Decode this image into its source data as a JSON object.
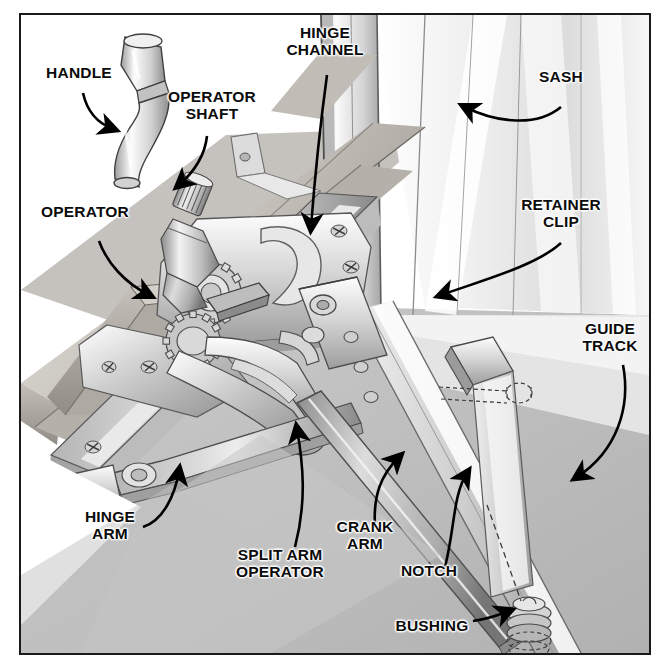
{
  "document": {
    "type": "technical-illustration",
    "subject": "Casement window split arm operator assembly",
    "style": "grayscale isometric cutaway line drawing",
    "frame_border_color": "#1a1a1a",
    "background_color": "#ffffff"
  },
  "callouts": [
    {
      "id": "handle",
      "label": "HANDLE",
      "x": 38,
      "y": 64,
      "w": 82,
      "align": "center",
      "pointer": "curved-arrow-down-right"
    },
    {
      "id": "operator-shaft",
      "label": "OPERATOR\nSHAFT",
      "x": 158,
      "y": 88,
      "w": 108,
      "align": "center",
      "pointer": "curved-arrow-down-left"
    },
    {
      "id": "hinge-channel",
      "label": "HINGE\nCHANNEL",
      "x": 273,
      "y": 24,
      "w": 104,
      "align": "center",
      "pointer": "long-curved-arrow-down"
    },
    {
      "id": "sash",
      "label": "SASH",
      "x": 531,
      "y": 68,
      "w": 60,
      "align": "center",
      "pointer": "curved-arrow-left"
    },
    {
      "id": "operator",
      "label": "OPERATOR",
      "x": 38,
      "y": 203,
      "w": 94,
      "align": "center",
      "pointer": "curved-arrow-down-right"
    },
    {
      "id": "retainer-clip",
      "label": "RETAINER\nCLIP",
      "x": 516,
      "y": 196,
      "w": 90,
      "align": "center",
      "pointer": "curved-arrow-down-left"
    },
    {
      "id": "guide-track",
      "label": "GUIDE\nTRACK",
      "x": 574,
      "y": 320,
      "w": 72,
      "align": "center",
      "pointer": "long-curved-arrow-down-left"
    },
    {
      "id": "hinge-arm",
      "label": "HINGE\nARM",
      "x": 74,
      "y": 508,
      "w": 72,
      "align": "center",
      "pointer": "curved-arrow-up-right"
    },
    {
      "id": "split-arm-operator",
      "label": "SPLIT ARM\nOPERATOR",
      "x": 228,
      "y": 546,
      "w": 104,
      "align": "center",
      "pointer": "long-curved-arrow-up-right"
    },
    {
      "id": "crank-arm",
      "label": "CRANK\nARM",
      "x": 330,
      "y": 518,
      "w": 70,
      "align": "center",
      "pointer": "curved-arrow-up-right"
    },
    {
      "id": "notch",
      "label": "NOTCH",
      "x": 396,
      "y": 562,
      "w": 66,
      "align": "center",
      "pointer": "curved-arrow-up-right"
    },
    {
      "id": "bushing",
      "label": "BUSHING",
      "x": 390,
      "y": 617,
      "w": 84,
      "align": "center",
      "pointer": "short-arrow-right"
    }
  ],
  "palette": {
    "ink": "#0b0b0b",
    "metal_light": "#f2f2f2",
    "metal_mid": "#c9c9c9",
    "metal_dark": "#9a9a9a",
    "metal_shadow": "#7a7a7a",
    "wood_light": "#d9d6d0",
    "wood_mid": "#b8b4ad",
    "wood_dark": "#8e8a84",
    "glass_light": "#fbfbfb",
    "glass_mid": "#e4e4e4",
    "ground_grey": "#bdbdbd"
  },
  "parts_legend": [
    "HANDLE",
    "OPERATOR SHAFT",
    "HINGE CHANNEL",
    "SASH",
    "OPERATOR",
    "RETAINER CLIP",
    "GUIDE TRACK",
    "HINGE ARM",
    "SPLIT ARM OPERATOR",
    "CRANK ARM",
    "NOTCH",
    "BUSHING"
  ]
}
